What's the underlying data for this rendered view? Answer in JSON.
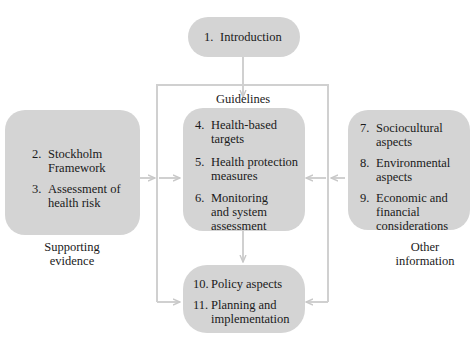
{
  "diagram": {
    "intro": {
      "num": "1.",
      "text": "Introduction"
    },
    "guidelines_label": "Guidelines",
    "supporting": {
      "items": [
        {
          "num": "2.",
          "lines": [
            "Stockholm",
            "Framework"
          ]
        },
        {
          "num": "3.",
          "lines": [
            "Assessment of",
            "health risk"
          ]
        }
      ],
      "caption_line1": "Supporting",
      "caption_line2": "evidence"
    },
    "guidelines": {
      "items": [
        {
          "num": "4.",
          "lines": [
            "Health-based",
            "targets"
          ]
        },
        {
          "num": "5.",
          "lines": [
            "Health protection",
            "measures"
          ]
        },
        {
          "num": "6.",
          "lines": [
            "Monitoring",
            "and system",
            "assessment"
          ]
        }
      ]
    },
    "other": {
      "items": [
        {
          "num": "7.",
          "lines": [
            "Sociocultural",
            "aspects"
          ]
        },
        {
          "num": "8.",
          "lines": [
            "Environmental",
            "aspects"
          ]
        },
        {
          "num": "9.",
          "lines": [
            "Economic and",
            "financial",
            "considerations"
          ]
        }
      ],
      "caption_line1": "Other",
      "caption_line2": "information"
    },
    "policy": {
      "items": [
        {
          "num": "10.",
          "lines": [
            "Policy aspects"
          ]
        },
        {
          "num": "11.",
          "lines": [
            "Planning and",
            "implementation"
          ]
        }
      ]
    },
    "colors": {
      "box": "#d4d4d4",
      "line": "#cfcfcf",
      "text": "#1a1a1a"
    }
  }
}
